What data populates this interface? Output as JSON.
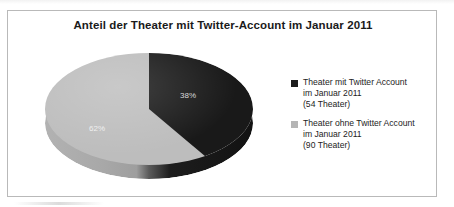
{
  "chart_data": {
    "type": "pie",
    "title": "Anteil der Theater mit Twitter-Account im Januar 2011",
    "categories": [
      "Theater mit Twitter Account im Januar 2011 (54 Theater)",
      "Theater ohne Twitter Account im Januar 2011 (90 Theater)"
    ],
    "values": [
      38,
      62
    ],
    "value_labels": [
      "38%",
      "62%"
    ],
    "counts": [
      54,
      90
    ],
    "total": 144,
    "units": "percent",
    "xlabel": "",
    "ylabel": "",
    "grid": false,
    "legend_position": "right",
    "three_d": true,
    "colors": [
      "#191919",
      "#bdbdbd"
    ]
  },
  "frame": {
    "title": "Anteil der Theater mit Twitter-Account im Januar 2011"
  },
  "pie": {
    "dark_label": "38%",
    "light_label": "62%"
  },
  "legend": {
    "entries": [
      {
        "marker": "dark",
        "lines": [
          "Theater mit Twitter Account",
          "im Januar 2011",
          "(54 Theater)"
        ]
      },
      {
        "marker": "light",
        "lines": [
          "Theater ohne Twitter Account",
          "im Januar 2011",
          "(90 Theater)"
        ]
      }
    ]
  }
}
